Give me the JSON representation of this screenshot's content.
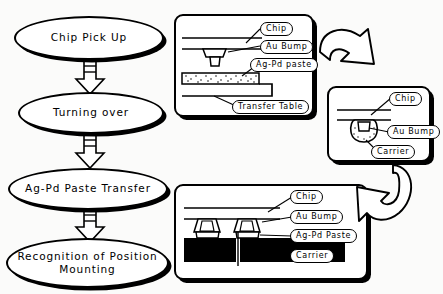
{
  "diagram": {
    "background_color": "#fbfbfa",
    "line_color": "#000000"
  },
  "flow": {
    "nodes": [
      {
        "id": "pick-up",
        "label": "Chip Pick Up"
      },
      {
        "id": "turn-over",
        "label": "Turning over"
      },
      {
        "id": "transfer",
        "label": "Ag-Pd Paste Transfer"
      },
      {
        "id": "mounting",
        "label": "Recognition of Position\nMounting"
      }
    ],
    "connectors": [
      {
        "id": "arrow-1",
        "from": "pick-up",
        "to": "turn-over",
        "shape": "block-down-arrow"
      },
      {
        "id": "arrow-2",
        "from": "turn-over",
        "to": "transfer",
        "shape": "block-down-arrow"
      },
      {
        "id": "arrow-3",
        "from": "transfer",
        "to": "mounting",
        "shape": "block-down-arrow"
      }
    ]
  },
  "panels": {
    "transfer_table": {
      "id": "panel-transfer-table",
      "labels": {
        "chip": "Chip",
        "au_bump": "Au Bump",
        "paste": "Ag-Pd paste",
        "table": "Transfer Table"
      },
      "paste_fill": "stippled"
    },
    "carrier_pickup": {
      "id": "panel-carrier-pickup",
      "labels": {
        "chip": "Chip",
        "au_bump": "Au Bump",
        "carrier": "Carrier"
      }
    },
    "mounted": {
      "id": "panel-mounted",
      "labels": {
        "chip": "Chip",
        "au_bump": "Au Bump",
        "paste": "Ag-Pd Paste",
        "carrier": "Carrier"
      },
      "carrier_fill": "#000000",
      "bump_count": 2
    }
  },
  "curved_arrows": [
    {
      "id": "curved-arrow-top",
      "from": "panel-transfer-table",
      "to": "panel-carrier-pickup",
      "direction": "right-down"
    },
    {
      "id": "curved-arrow-bottom",
      "from": "panel-carrier-pickup",
      "to": "panel-mounted",
      "direction": "down-left"
    }
  ]
}
